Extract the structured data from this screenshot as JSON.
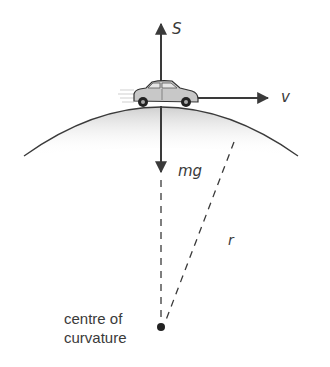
{
  "diagram": {
    "labels": {
      "normal_force": "S",
      "velocity": "v",
      "weight": "mg",
      "radius": "r",
      "centre_line1": "centre of",
      "centre_line2": "curvature"
    },
    "colors": {
      "line": "#3a3a3a",
      "hill_shade": "#d8d8d8",
      "car_body": "#c8c8c8",
      "text": "#3a3a3a"
    }
  }
}
